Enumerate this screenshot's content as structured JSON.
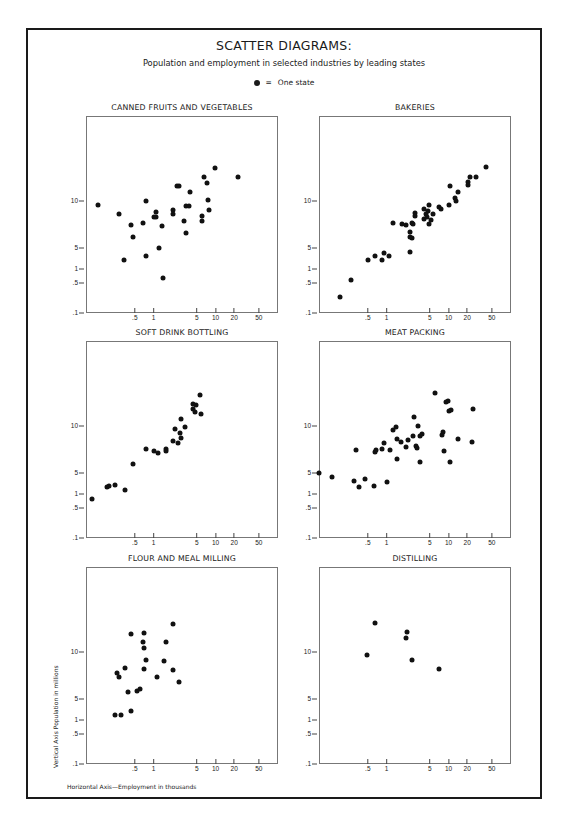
{
  "header": {
    "title": "SCATTER DIAGRAMS:",
    "subtitle": "Population and employment in selected industries by leading states",
    "legend_symbol": "●",
    "legend_equals": "=",
    "legend_label": "One state"
  },
  "axes": {
    "vertical_label": "Vertical Axis   Population in millions",
    "horizontal_label": "Horizontal Axis—Employment in thousands",
    "y_ticks": [
      {
        "label": "10",
        "value": 10
      },
      {
        "label": "5",
        "value": 5
      },
      {
        "label": "1",
        "value": 1
      },
      {
        "label": ".5",
        "value": 0.5
      },
      {
        "label": ".1",
        "value": 0.1
      }
    ],
    "x_ticks": [
      {
        "label": ".5",
        "value": 0.5
      },
      {
        "label": "1",
        "value": 1
      },
      {
        "label": "5",
        "value": 5
      },
      {
        "label": "10",
        "value": 10
      },
      {
        "label": "20",
        "value": 20
      },
      {
        "label": "50",
        "value": 50
      }
    ]
  },
  "chart_data": [
    {
      "type": "scatter",
      "title": "CANNED FRUITS AND VEGETABLES",
      "xlabel": "Employment in thousands",
      "ylabel": "Population in millions",
      "x_scale": "log",
      "grid": false,
      "points": [
        [
          0.125,
          9.5
        ],
        [
          0.28,
          8.5
        ],
        [
          0.43,
          7.3
        ],
        [
          0.47,
          6.1
        ],
        [
          0.33,
          2.5
        ],
        [
          0.67,
          7.6
        ],
        [
          0.75,
          9.9
        ],
        [
          0.75,
          3.3
        ],
        [
          1.0,
          8.2
        ],
        [
          1.1,
          8.2
        ],
        [
          1.08,
          8.7
        ],
        [
          1.35,
          7.2
        ],
        [
          1.24,
          4.9
        ],
        [
          1.42,
          0.65
        ],
        [
          2.1,
          8.9
        ],
        [
          2.1,
          8.5
        ],
        [
          2.35,
          11.5
        ],
        [
          2.6,
          11.5
        ],
        [
          3.1,
          7.8
        ],
        [
          3.4,
          9.4
        ],
        [
          3.7,
          9.4
        ],
        [
          3.4,
          6.5
        ],
        [
          3.9,
          10.8
        ],
        [
          6.1,
          8.3
        ],
        [
          6.1,
          7.8
        ],
        [
          6.6,
          12.4
        ],
        [
          7.2,
          11.8
        ],
        [
          7.5,
          10.0
        ],
        [
          7.9,
          8.9
        ],
        [
          9.9,
          13.4
        ],
        [
          23,
          12.5
        ]
      ]
    },
    {
      "type": "scatter",
      "title": "BAKERIES",
      "xlabel": "Employment in thousands",
      "ylabel": "Population in millions",
      "x_scale": "log",
      "grid": false,
      "points": [
        [
          0.18,
          0.3
        ],
        [
          0.27,
          0.57
        ],
        [
          0.5,
          2.5
        ],
        [
          0.65,
          3.3
        ],
        [
          0.84,
          2.6
        ],
        [
          0.91,
          3.9
        ],
        [
          1.1,
          3.2
        ],
        [
          1.26,
          7.6
        ],
        [
          1.8,
          7.5
        ],
        [
          2.1,
          7.3
        ],
        [
          2.6,
          7.6
        ],
        [
          2.65,
          7.4
        ],
        [
          2.9,
          8.6
        ],
        [
          2.9,
          8.3
        ],
        [
          2.4,
          6.6
        ],
        [
          2.4,
          6.1
        ],
        [
          2.6,
          6.0
        ],
        [
          2.4,
          4.1
        ],
        [
          4.0,
          9.0
        ],
        [
          4.0,
          8.0
        ],
        [
          4.3,
          8.5
        ],
        [
          4.7,
          8.8
        ],
        [
          4.55,
          8.2
        ],
        [
          4.9,
          9.5
        ],
        [
          4.85,
          7.5
        ],
        [
          5.2,
          7.9
        ],
        [
          5.55,
          8.5
        ],
        [
          7.0,
          9.3
        ],
        [
          7.5,
          9.0
        ],
        [
          10.2,
          9.5
        ],
        [
          10.7,
          11.5
        ],
        [
          12.7,
          10.2
        ],
        [
          13.2,
          9.9
        ],
        [
          14,
          10.9
        ],
        [
          20.4,
          11.9
        ],
        [
          20.9,
          11.6
        ],
        [
          22.2,
          12.5
        ],
        [
          27.5,
          12.5
        ],
        [
          41,
          13.5
        ]
      ]
    },
    {
      "type": "scatter",
      "title": "SOFT DRINK BOTTLING",
      "xlabel": "Employment in thousands",
      "ylabel": "Population in millions",
      "x_scale": "log",
      "grid": false,
      "points": [
        [
          0.1,
          0.78
        ],
        [
          0.18,
          2.1
        ],
        [
          0.19,
          2.3
        ],
        [
          0.24,
          2.5
        ],
        [
          0.35,
          1.6
        ],
        [
          0.46,
          5.9
        ],
        [
          0.76,
          7.4
        ],
        [
          1.0,
          7.2
        ],
        [
          1.2,
          7.0
        ],
        [
          1.6,
          7.5
        ],
        [
          1.6,
          7.2
        ],
        [
          2.05,
          8.3
        ],
        [
          2.2,
          9.6
        ],
        [
          2.5,
          8.1
        ],
        [
          2.7,
          9.1
        ],
        [
          2.75,
          8.6
        ],
        [
          2.8,
          10.6
        ],
        [
          3.25,
          9.8
        ],
        [
          4.3,
          12.2
        ],
        [
          4.3,
          11.7
        ],
        [
          4.7,
          11.4
        ],
        [
          4.85,
          12.1
        ],
        [
          5.6,
          13.2
        ],
        [
          5.8,
          11.2
        ]
      ]
    },
    {
      "type": "scatter",
      "title": "MEAT PACKING",
      "xlabel": "Employment in thousands",
      "ylabel": "Population in millions",
      "x_scale": "log",
      "grid": false,
      "points": [
        [
          0.082,
          4.75
        ],
        [
          0.13,
          4.0
        ],
        [
          0.3,
          3.3
        ],
        [
          0.32,
          7.3
        ],
        [
          0.36,
          2.2
        ],
        [
          0.45,
          3.6
        ],
        [
          0.63,
          2.3
        ],
        [
          0.65,
          7.1
        ],
        [
          0.68,
          7.3
        ],
        [
          0.84,
          7.4
        ],
        [
          0.92,
          8.1
        ],
        [
          1.0,
          3.1
        ],
        [
          1.14,
          7.3
        ],
        [
          1.29,
          9.5
        ],
        [
          1.4,
          9.8
        ],
        [
          1.5,
          8.5
        ],
        [
          1.5,
          6.4
        ],
        [
          1.73,
          8.2
        ],
        [
          2.1,
          7.7
        ],
        [
          2.25,
          8.4
        ],
        [
          2.7,
          8.8
        ],
        [
          2.8,
          10.8
        ],
        [
          3.0,
          7.8
        ],
        [
          3.1,
          7.6
        ],
        [
          3.25,
          9.9
        ],
        [
          3.5,
          8.8
        ],
        [
          3.5,
          6.1
        ],
        [
          3.75,
          9.0
        ],
        [
          6.0,
          13.4
        ],
        [
          7.9,
          8.9
        ],
        [
          8.2,
          9.3
        ],
        [
          8.6,
          7.2
        ],
        [
          9.0,
          12.5
        ],
        [
          9.7,
          12.6
        ],
        [
          10.2,
          11.5
        ],
        [
          10.4,
          6.1
        ],
        [
          10.9,
          11.6
        ],
        [
          14.2,
          8.5
        ],
        [
          24,
          8.2
        ],
        [
          24.8,
          11.7
        ]
      ]
    },
    {
      "type": "scatter",
      "title": "FLOUR AND MEAL MILLING",
      "xlabel": "Employment in thousands",
      "ylabel": "Population in millions",
      "x_scale": "log",
      "grid": false,
      "points": [
        [
          0.24,
          1.8
        ],
        [
          0.3,
          1.8
        ],
        [
          0.26,
          7.7
        ],
        [
          0.28,
          7.2
        ],
        [
          0.35,
          8.2
        ],
        [
          0.39,
          5.6
        ],
        [
          0.43,
          11.8
        ],
        [
          0.43,
          2.6
        ],
        [
          0.54,
          5.7
        ],
        [
          0.61,
          6.0
        ],
        [
          0.68,
          11.0
        ],
        [
          0.71,
          11.9
        ],
        [
          0.71,
          10.3
        ],
        [
          0.69,
          8.1
        ],
        [
          0.76,
          9.0
        ],
        [
          1.15,
          7.2
        ],
        [
          1.46,
          8.9
        ],
        [
          1.6,
          11.0
        ],
        [
          2.06,
          12.9
        ],
        [
          2.1,
          8.0
        ],
        [
          2.6,
          6.7
        ]
      ]
    },
    {
      "type": "scatter",
      "title": "DISTILLING",
      "xlabel": "Employment in thousands",
      "ylabel": "Population in millions",
      "x_scale": "log",
      "grid": false,
      "points": [
        [
          0.48,
          9.6
        ],
        [
          0.65,
          13.0
        ],
        [
          2.1,
          11.4
        ],
        [
          2.15,
          12.0
        ],
        [
          2.55,
          9.0
        ],
        [
          6.9,
          8.1
        ]
      ]
    }
  ]
}
